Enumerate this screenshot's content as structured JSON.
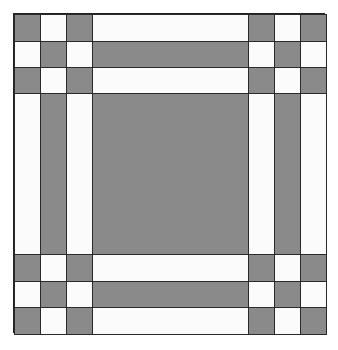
{
  "diagram": {
    "colors": {
      "gray": "#8a8a8a",
      "white": "#fbfbfb",
      "outline": "#2a2a2a"
    },
    "grid": {
      "columns": [
        "narrow",
        "narrow",
        "narrow",
        "wide",
        "narrow",
        "narrow",
        "narrow"
      ],
      "rows": [
        "narrow",
        "narrow",
        "narrow",
        "wide",
        "narrow",
        "narrow",
        "narrow"
      ],
      "cells": [
        [
          "g",
          "w",
          "g",
          "w",
          "g",
          "w",
          "g"
        ],
        [
          "w",
          "g",
          "w",
          "g",
          "w",
          "g",
          "w"
        ],
        [
          "g",
          "w",
          "g",
          "w",
          "g",
          "w",
          "g"
        ],
        [
          "w",
          "g",
          "w",
          "g",
          "w",
          "g",
          "w"
        ],
        [
          "g",
          "w",
          "g",
          "w",
          "g",
          "w",
          "g"
        ],
        [
          "w",
          "g",
          "w",
          "g",
          "w",
          "g",
          "w"
        ],
        [
          "g",
          "w",
          "g",
          "w",
          "g",
          "w",
          "g"
        ]
      ]
    },
    "regions": {
      "corner_blocks": "3x3 checkerboard (gray corners)",
      "horizontal_strips": [
        "white",
        "gray",
        "white"
      ],
      "vertical_strips": [
        "white",
        "gray",
        "white"
      ],
      "center_square": "gray"
    }
  }
}
